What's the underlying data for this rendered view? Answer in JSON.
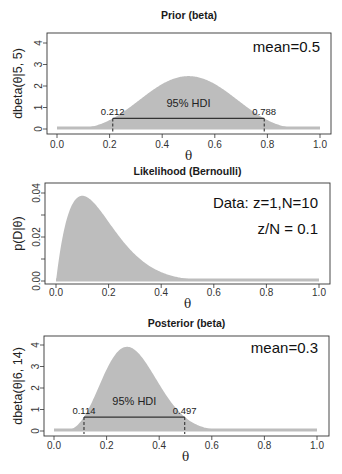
{
  "chart_data": [
    {
      "type": "area",
      "title": "Prior (beta)",
      "xlabel": "θ",
      "ylabel": "dbeta(θ|5, 5)",
      "distribution": {
        "family": "beta",
        "a": 5,
        "b": 5
      },
      "xlim": [
        0,
        1
      ],
      "ylim": [
        0,
        4
      ],
      "xticks": [
        "0.0",
        "0.2",
        "0.4",
        "0.6",
        "0.8",
        "1.0"
      ],
      "yticks": [
        "0",
        "1",
        "2",
        "3",
        "4"
      ],
      "annotations": [
        "mean=0.5"
      ],
      "hdi": {
        "label": "95% HDI",
        "low": 0.212,
        "high": 0.788,
        "low_label": "0.212",
        "high_label": "0.788"
      },
      "peak": {
        "x": 0.5,
        "y": 2.46
      },
      "fill_color": "#bdbdbd",
      "grid": false
    },
    {
      "type": "area",
      "title": "Likelihood (Bernoulli)",
      "xlabel": "θ",
      "ylabel": "p(D|θ)",
      "distribution": {
        "family": "bernoulli_likelihood",
        "z": 1,
        "N": 10
      },
      "xlim": [
        0,
        1
      ],
      "ylim": [
        0,
        0.04
      ],
      "xticks": [
        "0.0",
        "0.2",
        "0.4",
        "0.6",
        "0.8",
        "1.0"
      ],
      "yticks": [
        "0.00",
        "0.02",
        "0.04"
      ],
      "annotations": [
        "Data: z=1,N=10",
        "z/N = 0.1"
      ],
      "peak": {
        "x": 0.1,
        "y": 0.0387
      },
      "fill_color": "#bdbdbd",
      "grid": false
    },
    {
      "type": "area",
      "title": "Posterior (beta)",
      "xlabel": "θ",
      "ylabel": "dbeta(θ|6, 14)",
      "distribution": {
        "family": "beta",
        "a": 6,
        "b": 14
      },
      "xlim": [
        0,
        1
      ],
      "ylim": [
        0,
        4
      ],
      "xticks": [
        "0.0",
        "0.2",
        "0.4",
        "0.6",
        "0.8",
        "1.0"
      ],
      "yticks": [
        "0",
        "1",
        "2",
        "3",
        "4"
      ],
      "annotations": [
        "mean=0.3"
      ],
      "hdi": {
        "label": "95% HDI",
        "low": 0.114,
        "high": 0.497,
        "low_label": "0.114",
        "high_label": "0.497"
      },
      "peak": {
        "x": 0.278,
        "y": 3.9
      },
      "fill_color": "#bdbdbd",
      "grid": false
    }
  ],
  "panels": [
    {
      "title": "Prior (beta)",
      "ylabel": "dbeta(θ|5, 5)",
      "xlabel": "θ",
      "annotations": [
        "mean=0.5"
      ],
      "hdi_label": "95% HDI",
      "hdi_low_label": "0.212",
      "hdi_high_label": "0.788"
    },
    {
      "title": "Likelihood (Bernoulli)",
      "ylabel": "p(D|θ)",
      "xlabel": "θ",
      "annotations": [
        "Data: z=1,N=10",
        "z/N = 0.1"
      ]
    },
    {
      "title": "Posterior (beta)",
      "ylabel": "dbeta(θ|6, 14)",
      "xlabel": "θ",
      "annotations": [
        "mean=0.3"
      ],
      "hdi_label": "95% HDI",
      "hdi_low_label": "0.114",
      "hdi_high_label": "0.497"
    }
  ],
  "colors": {
    "fill": "#bdbdbd",
    "axis": "#333333",
    "hdi_line": "#333333",
    "background": "#ffffff"
  }
}
